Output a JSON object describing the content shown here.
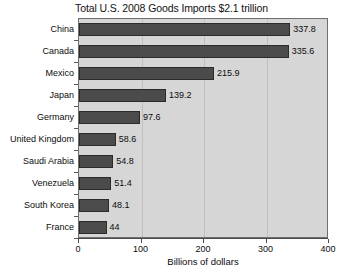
{
  "chart_data": {
    "type": "bar",
    "orientation": "horizontal",
    "title": "Total U.S. 2008 Goods Imports $2.1 trillion",
    "xlabel": "Billions of dollars",
    "ylabel": "",
    "categories": [
      "China",
      "Canada",
      "Mexico",
      "Japan",
      "Germany",
      "United Kingdom",
      "Saudi Arabia",
      "Venezuela",
      "South Korea",
      "France"
    ],
    "values": [
      337.8,
      335.6,
      215.9,
      139.2,
      97.6,
      58.6,
      54.8,
      51.4,
      48.1,
      44
    ],
    "value_labels": [
      "337.8",
      "335.6",
      "215.9",
      "139.2",
      "97.6",
      "58.6",
      "54.8",
      "51.4",
      "48.1",
      "44"
    ],
    "xlim": [
      0,
      400
    ],
    "xticks": [
      0,
      100,
      200,
      300,
      400
    ],
    "xticklabels": [
      "0",
      "100",
      "200",
      "300",
      "400"
    ],
    "grid": true,
    "grid_axis": "x",
    "legend": false,
    "colors": {
      "bar": "#4b4b4b",
      "bar_border": "#2b2b2b",
      "plot_background": "#d6d6d6",
      "gridline": "#c0c0c0",
      "axis": "#4a4a4a",
      "text": "#0c0c0c",
      "page_background": "#ffffff"
    }
  }
}
